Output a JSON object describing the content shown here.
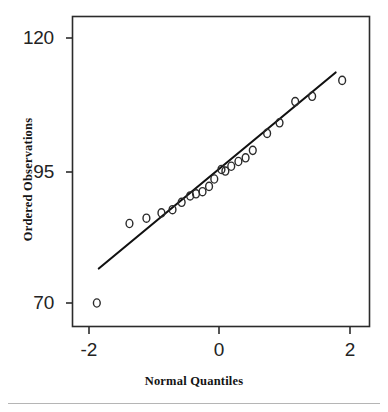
{
  "chart_data": {
    "type": "scatter",
    "title": "",
    "subtitle": "",
    "xlabel": "Normal Quantiles",
    "ylabel": "Ordered Observations",
    "xlim": [
      -2.3,
      2.32
    ],
    "ylim": [
      65.5,
      123.5
    ],
    "xticks": [
      -2,
      0,
      2
    ],
    "xtick_labels": [
      "-2",
      "0",
      "2"
    ],
    "yticks": [
      70,
      95,
      120
    ],
    "ytick_labels": [
      "70",
      "95",
      "120"
    ],
    "grid": false,
    "legend": "none",
    "marker": "open-circle",
    "series": [
      {
        "name": "Ordered Observations",
        "type": "scatter",
        "points": [
          {
            "x": -1.88,
            "y": 70.0
          },
          {
            "x": -1.38,
            "y": 85.0
          },
          {
            "x": -1.12,
            "y": 86.0
          },
          {
            "x": -0.89,
            "y": 87.0
          },
          {
            "x": -0.72,
            "y": 87.6
          },
          {
            "x": -0.58,
            "y": 89.0
          },
          {
            "x": -0.45,
            "y": 90.2
          },
          {
            "x": -0.36,
            "y": 90.6
          },
          {
            "x": -0.26,
            "y": 91.0
          },
          {
            "x": -0.16,
            "y": 92.0
          },
          {
            "x": -0.08,
            "y": 93.4
          },
          {
            "x": 0.03,
            "y": 95.2
          },
          {
            "x": 0.09,
            "y": 94.9
          },
          {
            "x": 0.18,
            "y": 95.8
          },
          {
            "x": 0.29,
            "y": 96.7
          },
          {
            "x": 0.4,
            "y": 97.4
          },
          {
            "x": 0.51,
            "y": 98.8
          },
          {
            "x": 0.73,
            "y": 102.0
          },
          {
            "x": 0.92,
            "y": 104.0
          },
          {
            "x": 1.16,
            "y": 108.0
          },
          {
            "x": 1.42,
            "y": 109.0
          },
          {
            "x": 1.88,
            "y": 112.0
          }
        ]
      },
      {
        "name": "Reference Line",
        "type": "line",
        "x0": -1.85,
        "y0": 76.5,
        "x1": 1.78,
        "y1": 113.5
      }
    ]
  },
  "axes": {
    "ylabel_text": "Ordered Observations",
    "xlabel_text": "Normal Quantiles",
    "ytick_labels": [
      "120",
      "95",
      "70"
    ],
    "xtick_labels": [
      "-2",
      "0",
      "2"
    ]
  },
  "style": {
    "frame_color": "#2b2b2b",
    "marker_color": "#2b2b2b",
    "line_color": "#111111",
    "background": "#ffffff",
    "text_color": "#1a1a1a",
    "rule_color": "#b5b5b5"
  }
}
